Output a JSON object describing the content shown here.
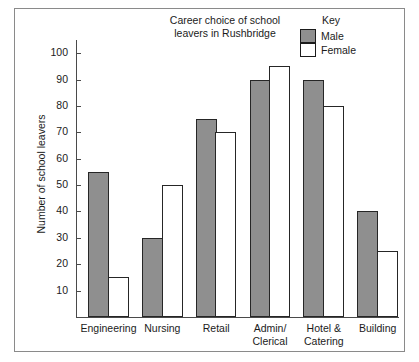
{
  "chart_data": {
    "type": "bar",
    "title": "Career choice of school\nleavers in Rushbridge",
    "xlabel": "",
    "ylabel": "Number of school leavers",
    "categories": [
      "Engineering",
      "Nursing",
      "Retail",
      "Admin/\nClerical",
      "Hotel &\nCatering",
      "Building"
    ],
    "series": [
      {
        "name": "Male",
        "values": [
          55,
          30,
          75,
          90,
          90,
          40
        ],
        "color": "#8f8f8f"
      },
      {
        "name": "Female",
        "values": [
          15,
          50,
          70,
          95,
          80,
          25
        ],
        "color": "#ffffff"
      }
    ],
    "ylim": [
      0,
      105
    ],
    "yticks": [
      10,
      20,
      30,
      40,
      50,
      60,
      70,
      80,
      90,
      100
    ],
    "ytick_labels": [
      "10",
      "20",
      "30",
      "40",
      "50",
      "60",
      "70",
      "80",
      "90",
      "100"
    ],
    "grid": false,
    "legend": {
      "title": "Key",
      "position": "top-right",
      "entries": [
        "Male",
        "Female"
      ]
    }
  },
  "legend": {
    "title": "Key",
    "items": [
      {
        "label": "Male"
      },
      {
        "label": "Female"
      }
    ]
  },
  "axes": {
    "y_title": "Number of school leavers"
  }
}
